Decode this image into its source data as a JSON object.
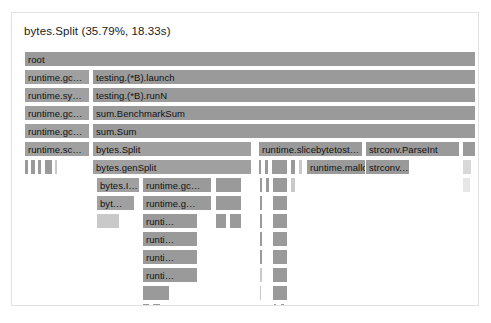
{
  "panel": {
    "title": "bytes.Split (35.79%, 18.33s)",
    "background": "#ffffff",
    "border_color": "#e2e2e2",
    "frame_color": "#a9a9a9",
    "frame_border": "#ffffff",
    "text_color": "#111111"
  },
  "chart_data": {
    "type": "flamegraph",
    "title": "bytes.Split (35.79%, 18.33s)",
    "root_label": "root",
    "selected_frame": "bytes.Split",
    "selected_percent": "35.79%",
    "selected_time": "18.33s",
    "row_height": 18,
    "total_width": 460,
    "depth": 14,
    "frames": [
      {
        "row": 0,
        "x": 8,
        "w": 452,
        "label": "root",
        "style": "dk"
      },
      {
        "row": 1,
        "x": 8,
        "w": 66,
        "label": "runtime.gc…",
        "style": "hl"
      },
      {
        "row": 1,
        "x": 76,
        "w": 384,
        "label": "testing.(*B).launch",
        "style": "dk"
      },
      {
        "row": 2,
        "x": 8,
        "w": 66,
        "label": "runtime.sy…",
        "style": "hl"
      },
      {
        "row": 2,
        "x": 76,
        "w": 384,
        "label": "testing.(*B).runN",
        "style": "dk"
      },
      {
        "row": 3,
        "x": 8,
        "w": 66,
        "label": "runtime.gc…",
        "style": "hl"
      },
      {
        "row": 3,
        "x": 76,
        "w": 384,
        "label": "sum.BenchmarkSum",
        "style": "dk"
      },
      {
        "row": 4,
        "x": 8,
        "w": 66,
        "label": "runtime.gc…",
        "style": "hl"
      },
      {
        "row": 4,
        "x": 76,
        "w": 384,
        "label": "sum.Sum",
        "style": "dk"
      },
      {
        "row": 5,
        "x": 8,
        "w": 66,
        "label": "runtime.sc…",
        "style": "hl"
      },
      {
        "row": 5,
        "x": 76,
        "w": 160,
        "label": "bytes.Split",
        "style": "hl"
      },
      {
        "row": 5,
        "x": 242,
        "w": 105,
        "label": "runtime.slicebytetost…",
        "style": "dk"
      },
      {
        "row": 5,
        "x": 349,
        "w": 95,
        "label": "strconv.ParseInt",
        "style": "dk"
      },
      {
        "row": 5,
        "x": 446,
        "w": 14,
        "label": "",
        "style": "dk"
      },
      {
        "row": 6,
        "x": 8,
        "w": 5,
        "label": "",
        "style": "dk"
      },
      {
        "row": 6,
        "x": 14,
        "w": 6,
        "label": "",
        "style": "dk"
      },
      {
        "row": 6,
        "x": 21,
        "w": 5,
        "label": "",
        "style": "dk"
      },
      {
        "row": 6,
        "x": 28,
        "w": 9,
        "label": "",
        "style": "dk"
      },
      {
        "row": 6,
        "x": 38,
        "w": 4,
        "label": "",
        "style": "pale"
      },
      {
        "row": 6,
        "x": 76,
        "w": 160,
        "label": "bytes.genSplit",
        "style": "hl"
      },
      {
        "row": 6,
        "x": 242,
        "w": 4,
        "label": "",
        "style": "dk"
      },
      {
        "row": 6,
        "x": 248,
        "w": 5,
        "label": "",
        "style": "dk"
      },
      {
        "row": 6,
        "x": 255,
        "w": 17,
        "label": "",
        "style": "dk"
      },
      {
        "row": 6,
        "x": 274,
        "w": 6,
        "label": "",
        "style": "dk"
      },
      {
        "row": 6,
        "x": 282,
        "w": 5,
        "label": "",
        "style": "pale"
      },
      {
        "row": 6,
        "x": 290,
        "w": 62,
        "label": "runtime.mallo…",
        "style": "dk"
      },
      {
        "row": 6,
        "x": 349,
        "w": 45,
        "label": "strconv.…",
        "style": "dk"
      },
      {
        "row": 6,
        "x": 446,
        "w": 10,
        "label": "",
        "style": "faint"
      },
      {
        "row": 7,
        "x": 9,
        "w": 2,
        "label": "",
        "style": "pale"
      },
      {
        "row": 7,
        "x": 20,
        "w": 2,
        "label": "",
        "style": "pale"
      },
      {
        "row": 7,
        "x": 80,
        "w": 44,
        "label": "bytes.I…",
        "style": "hl"
      },
      {
        "row": 7,
        "x": 126,
        "w": 70,
        "label": "runtime.gc…",
        "style": "dk"
      },
      {
        "row": 7,
        "x": 199,
        "w": 27,
        "label": "",
        "style": "dk"
      },
      {
        "row": 7,
        "x": 243,
        "w": 4,
        "label": "",
        "style": "dk"
      },
      {
        "row": 7,
        "x": 249,
        "w": 5,
        "label": "",
        "style": "dk"
      },
      {
        "row": 7,
        "x": 256,
        "w": 16,
        "label": "",
        "style": "dk"
      },
      {
        "row": 7,
        "x": 274,
        "w": 6,
        "label": "",
        "style": "pale"
      },
      {
        "row": 7,
        "x": 446,
        "w": 9,
        "label": "",
        "style": "vfaint"
      },
      {
        "row": 8,
        "x": 9,
        "w": 2,
        "label": "",
        "style": "pale"
      },
      {
        "row": 8,
        "x": 20,
        "w": 2,
        "label": "",
        "style": "dk"
      },
      {
        "row": 8,
        "x": 80,
        "w": 39,
        "label": "byt…",
        "style": "hl"
      },
      {
        "row": 8,
        "x": 126,
        "w": 70,
        "label": "runtime.g…",
        "style": "dk"
      },
      {
        "row": 8,
        "x": 199,
        "w": 27,
        "label": "",
        "style": "dk"
      },
      {
        "row": 8,
        "x": 243,
        "w": 4,
        "label": "",
        "style": "dk"
      },
      {
        "row": 8,
        "x": 256,
        "w": 16,
        "label": "",
        "style": "dk"
      },
      {
        "row": 9,
        "x": 20,
        "w": 2,
        "label": "",
        "style": "dk"
      },
      {
        "row": 9,
        "x": 80,
        "w": 24,
        "label": "",
        "style": "pale"
      },
      {
        "row": 9,
        "x": 126,
        "w": 56,
        "label": "runti…",
        "style": "dk"
      },
      {
        "row": 9,
        "x": 199,
        "w": 12,
        "label": "",
        "style": "dk"
      },
      {
        "row": 9,
        "x": 213,
        "w": 13,
        "label": "",
        "style": "dk"
      },
      {
        "row": 9,
        "x": 243,
        "w": 4,
        "label": "",
        "style": "dk"
      },
      {
        "row": 9,
        "x": 256,
        "w": 16,
        "label": "",
        "style": "dk"
      },
      {
        "row": 10,
        "x": 20,
        "w": 2,
        "label": "",
        "style": "pale"
      },
      {
        "row": 10,
        "x": 126,
        "w": 56,
        "label": "runti…",
        "style": "dk"
      },
      {
        "row": 10,
        "x": 243,
        "w": 4,
        "label": "",
        "style": "dk"
      },
      {
        "row": 10,
        "x": 256,
        "w": 16,
        "label": "",
        "style": "dk"
      },
      {
        "row": 11,
        "x": 126,
        "w": 56,
        "label": "runti…",
        "style": "dk"
      },
      {
        "row": 11,
        "x": 243,
        "w": 4,
        "label": "",
        "style": "dk"
      },
      {
        "row": 11,
        "x": 256,
        "w": 16,
        "label": "",
        "style": "dk"
      },
      {
        "row": 12,
        "x": 126,
        "w": 56,
        "label": "runti…",
        "style": "dk"
      },
      {
        "row": 12,
        "x": 243,
        "w": 4,
        "label": "",
        "style": "pale"
      },
      {
        "row": 12,
        "x": 256,
        "w": 16,
        "label": "",
        "style": "dk"
      },
      {
        "row": 13,
        "x": 126,
        "w": 28,
        "label": "",
        "style": "dk"
      },
      {
        "row": 13,
        "x": 243,
        "w": 3,
        "label": "",
        "style": "pale"
      },
      {
        "row": 13,
        "x": 256,
        "w": 16,
        "label": "",
        "style": "dk"
      },
      {
        "row": 14,
        "x": 126,
        "w": 8,
        "label": "",
        "style": "dk"
      },
      {
        "row": 14,
        "x": 136,
        "w": 9,
        "label": "",
        "style": "dk"
      },
      {
        "row": 14,
        "x": 257,
        "w": 4,
        "label": "",
        "style": "dk"
      },
      {
        "row": 14,
        "x": 264,
        "w": 5,
        "label": "",
        "style": "dk"
      },
      {
        "row": 15,
        "x": 126,
        "w": 3,
        "label": "",
        "style": "dk"
      },
      {
        "row": 15,
        "x": 133,
        "w": 3,
        "label": "",
        "style": "dk"
      },
      {
        "row": 15,
        "x": 257,
        "w": 3,
        "label": "",
        "style": "pale"
      },
      {
        "row": 15,
        "x": 264,
        "w": 3,
        "label": "",
        "style": "pale"
      }
    ]
  }
}
